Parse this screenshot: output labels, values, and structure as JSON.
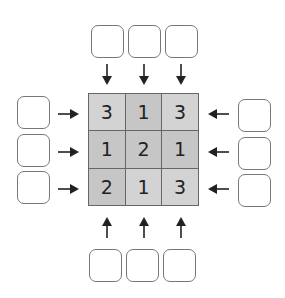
{
  "puzzle": {
    "grid": [
      [
        "3",
        "1",
        "3"
      ],
      [
        "1",
        "2",
        "1"
      ],
      [
        "2",
        "1",
        "3"
      ]
    ],
    "clues": {
      "top": [
        "",
        "",
        ""
      ],
      "bottom": [
        "",
        "",
        ""
      ],
      "left": [
        "",
        "",
        ""
      ],
      "right": [
        "",
        "",
        ""
      ]
    },
    "colors": {
      "cell": "#d3d3d3",
      "cell_dark": "#c6c6c6",
      "border": "#666666",
      "arrow": "#222222"
    }
  }
}
